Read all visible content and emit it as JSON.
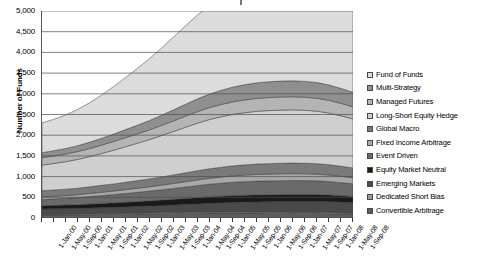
{
  "axes": {
    "ylabel": "Number of Funds",
    "yticks": [
      "5,000",
      "4,500",
      "4,000",
      "3,500",
      "3,000",
      "2,500",
      "2,000",
      "1,500",
      "1,000",
      "500",
      "0"
    ],
    "xticks": [
      "1-Jan-00",
      "1-May-00",
      "1-Sep-00",
      "1-Jan-01",
      "1-May-01",
      "1-Sep-01",
      "1-Jan-02",
      "1-May-02",
      "1-Sep-02",
      "1-Jan-03",
      "1-May-03",
      "1-Sep-03",
      "1-Jan-04",
      "1-May-04",
      "1-Sep-04",
      "1-Jan-05",
      "1-May-05",
      "1-Sep-05",
      "1-Jan-06",
      "1-May-06",
      "1-Sep-06",
      "1-Jan-07",
      "1-May-07",
      "1-Sep-07",
      "1-Jan-08",
      "1-May-08",
      "1-Sep-08"
    ]
  },
  "legend": {
    "items": [
      {
        "label": "Fund of Funds",
        "color": "#dcdcdc"
      },
      {
        "label": "Multi-Strategy",
        "color": "#8f8f8f"
      },
      {
        "label": "Managed Futures",
        "color": "#b4b4b4"
      },
      {
        "label": "Long-Short Equity Hedge",
        "color": "#cfcfcf"
      },
      {
        "label": "Global Macro",
        "color": "#7a7a7a"
      },
      {
        "label": "Fixed Income Arbitrage",
        "color": "#a8a8a8"
      },
      {
        "label": "Event Driven",
        "color": "#6a6a6a"
      },
      {
        "label": "Equity Market Neutral",
        "color": "#1a1a1a"
      },
      {
        "label": "Emerging Markets",
        "color": "#4a4a4a"
      },
      {
        "label": "Dedicated Short Bias",
        "color": "#9a9a9a"
      },
      {
        "label": "Convertible Arbitrage",
        "color": "#5c5c5c"
      }
    ]
  },
  "chart_data": {
    "type": "area",
    "title": "",
    "xlabel": "",
    "ylabel": "Number of Funds",
    "ylim": [
      0,
      5000
    ],
    "grid": true,
    "legend_position": "right",
    "stacked": true,
    "stack_order_bottom_to_top": [
      "Convertible Arbitrage",
      "Dedicated Short Bias",
      "Emerging Markets",
      "Equity Market Neutral",
      "Event Driven",
      "Fixed Income Arbitrage",
      "Global Macro",
      "Long-Short Equity Hedge",
      "Managed Futures",
      "Multi-Strategy",
      "Fund of Funds"
    ],
    "x": [
      "1-Jan-00",
      "1-May-00",
      "1-Sep-00",
      "1-Jan-01",
      "1-May-01",
      "1-Sep-01",
      "1-Jan-02",
      "1-May-02",
      "1-Sep-02",
      "1-Jan-03",
      "1-May-03",
      "1-Sep-03",
      "1-Jan-04",
      "1-May-04",
      "1-Sep-04",
      "1-Jan-05",
      "1-May-05",
      "1-Sep-05",
      "1-Jan-06",
      "1-May-06",
      "1-Sep-06",
      "1-Jan-07",
      "1-May-07",
      "1-Sep-07",
      "1-Jan-08",
      "1-May-08",
      "1-Sep-08"
    ],
    "series": [
      {
        "name": "Convertible Arbitrage",
        "values": [
          70,
          72,
          74,
          76,
          80,
          84,
          88,
          92,
          96,
          100,
          104,
          108,
          112,
          116,
          118,
          120,
          120,
          119,
          118,
          116,
          114,
          112,
          110,
          108,
          104,
          100,
          96
        ]
      },
      {
        "name": "Dedicated Short Bias",
        "values": [
          18,
          18,
          18,
          19,
          19,
          20,
          20,
          21,
          21,
          22,
          22,
          23,
          24,
          24,
          25,
          25,
          25,
          25,
          25,
          24,
          24,
          24,
          23,
          23,
          22,
          22,
          21
        ]
      },
      {
        "name": "Emerging Markets",
        "values": [
          130,
          132,
          134,
          136,
          140,
          144,
          148,
          152,
          158,
          164,
          172,
          180,
          190,
          200,
          210,
          220,
          230,
          238,
          246,
          252,
          258,
          264,
          268,
          270,
          268,
          262,
          255
        ]
      },
      {
        "name": "Equity Market Neutral",
        "values": [
          80,
          84,
          88,
          92,
          98,
          104,
          110,
          116,
          122,
          128,
          134,
          140,
          146,
          152,
          158,
          162,
          166,
          168,
          170,
          170,
          170,
          169,
          168,
          166,
          162,
          156,
          150
        ]
      },
      {
        "name": "Event Driven",
        "values": [
          150,
          156,
          162,
          170,
          180,
          190,
          200,
          212,
          224,
          236,
          250,
          264,
          278,
          292,
          304,
          314,
          322,
          328,
          332,
          334,
          336,
          336,
          334,
          330,
          324,
          314,
          304
        ]
      },
      {
        "name": "Fixed Income Arbitrage",
        "values": [
          60,
          63,
          66,
          70,
          75,
          80,
          86,
          92,
          98,
          105,
          112,
          120,
          128,
          136,
          144,
          150,
          156,
          160,
          163,
          165,
          166,
          166,
          165,
          163,
          159,
          154,
          148
        ]
      },
      {
        "name": "Global Macro",
        "values": [
          150,
          152,
          155,
          158,
          162,
          167,
          172,
          178,
          184,
          190,
          198,
          206,
          214,
          222,
          230,
          236,
          242,
          246,
          250,
          252,
          254,
          255,
          254,
          252,
          248,
          242,
          235
        ]
      },
      {
        "name": "Long-Short Equity Hedge",
        "values": [
          620,
          640,
          665,
          695,
          730,
          770,
          815,
          860,
          905,
          950,
          1000,
          1050,
          1100,
          1150,
          1190,
          1220,
          1245,
          1262,
          1275,
          1282,
          1286,
          1286,
          1280,
          1268,
          1248,
          1218,
          1185
        ]
      },
      {
        "name": "Managed Futures",
        "values": [
          180,
          183,
          186,
          190,
          196,
          202,
          210,
          218,
          226,
          235,
          245,
          256,
          267,
          278,
          288,
          296,
          303,
          308,
          312,
          314,
          316,
          316,
          315,
          312,
          307,
          300,
          292
        ]
      },
      {
        "name": "Multi-Strategy",
        "values": [
          120,
          126,
          133,
          142,
          153,
          165,
          179,
          194,
          210,
          227,
          246,
          266,
          287,
          308,
          327,
          343,
          357,
          368,
          376,
          381,
          384,
          385,
          383,
          379,
          372,
          362,
          350
        ]
      },
      {
        "name": "Fund of Funds",
        "values": [
          720,
          760,
          810,
          875,
          955,
          1045,
          1150,
          1260,
          1375,
          1495,
          1625,
          1760,
          1895,
          2025,
          2140,
          2235,
          2310,
          2365,
          2405,
          2430,
          2445,
          2450,
          2440,
          2415,
          2370,
          2305,
          2230
        ]
      }
    ],
    "total_peak": 4650,
    "total_start": 2298,
    "total_end": 4266
  }
}
